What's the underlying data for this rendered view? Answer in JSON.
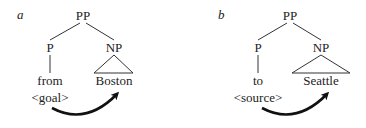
{
  "panels": [
    {
      "label": "a",
      "root": "PP",
      "left_node": "P",
      "right_node": "NP",
      "left_word": "from",
      "right_word": "Boston",
      "role": "<goal>"
    },
    {
      "label": "b",
      "root": "PP",
      "left_node": "P",
      "right_node": "NP",
      "left_word": "to",
      "right_word": "Seattle",
      "role": "<source>"
    }
  ]
}
